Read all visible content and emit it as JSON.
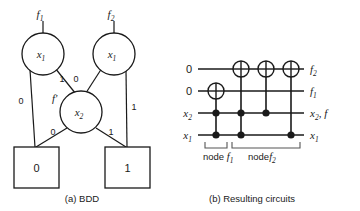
{
  "figure": {
    "panels": [
      {
        "id": "a",
        "caption": "(a) BDD"
      },
      {
        "id": "b",
        "caption": "(b) Resulting circuits"
      }
    ]
  },
  "bdd": {
    "title": "(a) BDD",
    "root_labels": [
      {
        "name": "f1",
        "text": "f",
        "sub": "1"
      },
      {
        "name": "f2",
        "text": "f",
        "sub": "2"
      }
    ],
    "nodes": [
      {
        "id": "n1",
        "var": "x",
        "sub": "1",
        "shape": "circle"
      },
      {
        "id": "n2",
        "var": "x",
        "sub": "1",
        "shape": "circle"
      },
      {
        "id": "n3",
        "var": "x",
        "sub": "2",
        "shape": "circle",
        "annotation": "f'"
      }
    ],
    "terminals": [
      {
        "id": "t0",
        "label": "0",
        "shape": "square"
      },
      {
        "id": "t1",
        "label": "1",
        "shape": "square"
      }
    ],
    "edge_labels": {
      "left_outer": "0",
      "left_inner": "1",
      "right_inner": "0",
      "right_outer": "1",
      "x2_low": "0",
      "x2_high": "1"
    },
    "shared_node_annotation": "f'"
  },
  "circuit": {
    "title": "(b) Resulting circuits",
    "wires": [
      {
        "index": 0,
        "input": "0",
        "output_text": "f",
        "output_sub": "2"
      },
      {
        "index": 1,
        "input": "0",
        "output_text": "f",
        "output_sub": "1"
      },
      {
        "index": 2,
        "input_text": "x",
        "input_sub": "2",
        "output_text": "x",
        "output_sub": "2",
        "output_extra": ", f"
      },
      {
        "index": 3,
        "input_text": "x",
        "input_sub": "1",
        "output_text": "x",
        "output_sub": "1"
      }
    ],
    "gates": [
      {
        "id": "g1",
        "type": "toffoli",
        "target_wire": 1,
        "control_wires": [
          2,
          3
        ]
      },
      {
        "id": "g2",
        "type": "toffoli",
        "target_wire": 0,
        "control_wires": [
          2,
          3
        ]
      },
      {
        "id": "g3",
        "type": "cnot",
        "target_wire": 0,
        "control_wires": [
          2
        ]
      },
      {
        "id": "g4",
        "type": "cnot",
        "target_wire": 0,
        "control_wires": [
          3
        ]
      }
    ],
    "brackets": [
      {
        "id": "b1",
        "label_plain": "node ",
        "label_var": "f",
        "label_sub": "1",
        "spans": [
          "g1"
        ]
      },
      {
        "id": "b2",
        "label_plain": "node",
        "label_var": "f",
        "label_sub": "2",
        "spans": [
          "g2",
          "g3",
          "g4"
        ]
      }
    ]
  },
  "colors": {
    "ink": "#1a1a1a",
    "bracket": "#555555",
    "background": "#ffffff"
  }
}
